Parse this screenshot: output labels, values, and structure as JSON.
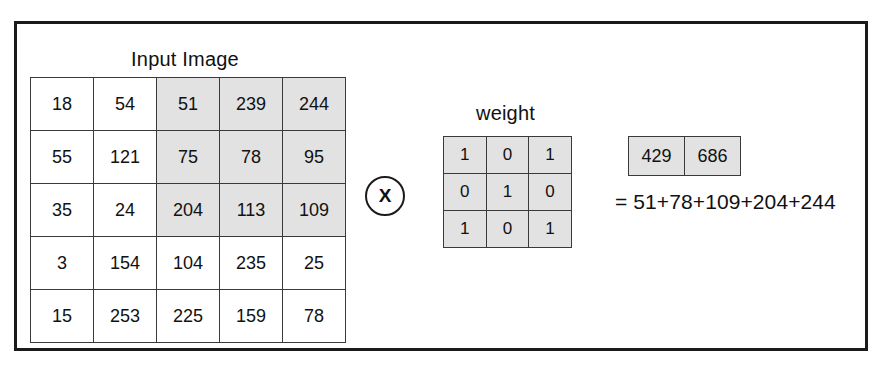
{
  "figure": {
    "input_label": "Input Image",
    "weight_label": "weight",
    "operator": "X",
    "equation": "= 51+78+109+204+244",
    "colors": {
      "frame": "#1b1b1b",
      "cell_border": "#3a3a3a",
      "shaded_cell": "#e2e2e2",
      "background": "#ffffff",
      "text": "#111111"
    }
  },
  "input_matrix": {
    "rows": 5,
    "cols": 5,
    "values": [
      [
        18,
        54,
        51,
        239,
        244
      ],
      [
        55,
        121,
        75,
        78,
        95
      ],
      [
        35,
        24,
        204,
        113,
        109
      ],
      [
        3,
        154,
        104,
        235,
        25
      ],
      [
        15,
        253,
        225,
        159,
        78
      ]
    ],
    "shaded": [
      [
        false,
        false,
        true,
        true,
        true
      ],
      [
        false,
        false,
        true,
        true,
        true
      ],
      [
        false,
        false,
        true,
        true,
        true
      ],
      [
        false,
        false,
        false,
        false,
        false
      ],
      [
        false,
        false,
        false,
        false,
        false
      ]
    ]
  },
  "weight_matrix": {
    "rows": 3,
    "cols": 3,
    "values": [
      [
        1,
        0,
        1
      ],
      [
        0,
        1,
        0
      ],
      [
        1,
        0,
        1
      ]
    ]
  },
  "output_matrix": {
    "rows": 1,
    "cols": 2,
    "values": [
      [
        429,
        686
      ]
    ]
  },
  "chart_data": {
    "type": "table",
    "title": "Input Image",
    "input_image": [
      [
        18,
        54,
        51,
        239,
        244
      ],
      [
        55,
        121,
        75,
        78,
        95
      ],
      [
        35,
        24,
        204,
        113,
        109
      ],
      [
        3,
        154,
        104,
        235,
        25
      ],
      [
        15,
        253,
        225,
        159,
        78
      ]
    ],
    "highlighted_window": {
      "rows": [
        0,
        1,
        2
      ],
      "cols": [
        2,
        3,
        4
      ],
      "values": [
        [
          51,
          239,
          244
        ],
        [
          75,
          78,
          95
        ],
        [
          204,
          113,
          109
        ]
      ]
    },
    "kernel": [
      [
        1,
        0,
        1
      ],
      [
        0,
        1,
        0
      ],
      [
        1,
        0,
        1
      ]
    ],
    "kernel_label": "weight",
    "operation": "X",
    "output": [
      429,
      686
    ],
    "worked_example": "= 51+78+109+204+244",
    "worked_example_terms": [
      51,
      78,
      109,
      204,
      244
    ],
    "worked_example_sum": 686
  }
}
